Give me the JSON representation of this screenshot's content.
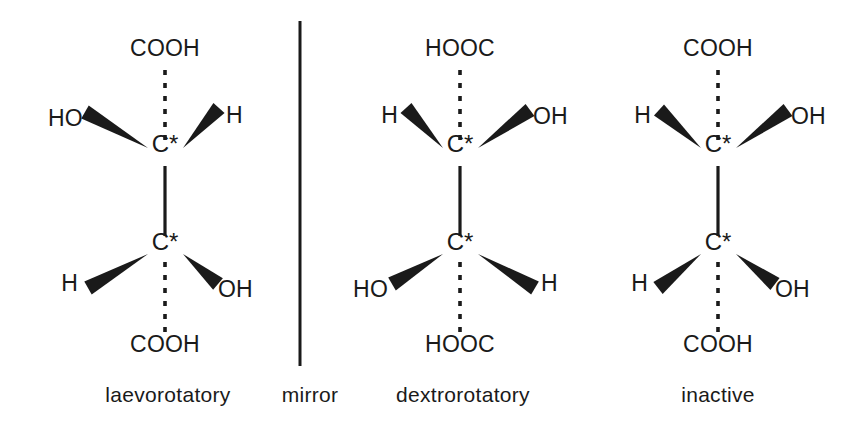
{
  "figure": {
    "background_color": "#ffffff",
    "ink_color": "#1a1a1a",
    "width": 868,
    "height": 429
  },
  "mirror": {
    "caption": "mirror",
    "caption_x": 310,
    "caption_y": 402,
    "line_x": 300,
    "line_y1": 21,
    "line_y2": 366
  },
  "molecules": [
    {
      "id": "laevorotatory",
      "caption": "laevorotatory",
      "caption_x": 168,
      "caption_y": 402,
      "center_x": 165,
      "top_carbon": {
        "label": "C*",
        "x": 165,
        "y": 152,
        "substituents": [
          {
            "name": "top",
            "text": "COOH",
            "bond": "dashed",
            "label_x": 165,
            "label_y": 56,
            "anchor": "middle",
            "tip_x": 165,
            "tip_y": 140,
            "end_x": 165,
            "end_y": 66
          },
          {
            "name": "upper-left",
            "text": "HO",
            "bond": "wedge",
            "label_x": 48,
            "label_y": 126,
            "anchor": "start",
            "tip_x": 148,
            "tip_y": 148,
            "end_x": 85,
            "end_y": 112
          },
          {
            "name": "upper-right",
            "text": "H",
            "bond": "wedge",
            "label_x": 226,
            "label_y": 123,
            "anchor": "start",
            "tip_x": 183,
            "tip_y": 148,
            "end_x": 219,
            "end_y": 108
          }
        ]
      },
      "bottom_carbon": {
        "label": "C*",
        "x": 165,
        "y": 250,
        "substituents": [
          {
            "name": "bottom",
            "text": "COOH",
            "bond": "dashed",
            "label_x": 165,
            "label_y": 352,
            "anchor": "middle",
            "tip_x": 165,
            "tip_y": 262,
            "end_x": 165,
            "end_y": 334
          },
          {
            "name": "lower-left",
            "text": "H",
            "bond": "wedge",
            "label_x": 78,
            "label_y": 291,
            "anchor": "end",
            "tip_x": 148,
            "tip_y": 254,
            "end_x": 88,
            "end_y": 288
          },
          {
            "name": "lower-right",
            "text": "OH",
            "bond": "wedge",
            "label_x": 218,
            "label_y": 297,
            "anchor": "start",
            "tip_x": 183,
            "tip_y": 254,
            "end_x": 218,
            "end_y": 284
          }
        ]
      },
      "backbone": {
        "x": 165,
        "y1": 166,
        "y2": 236
      }
    },
    {
      "id": "dextrorotatory",
      "caption": "dextrorotatory",
      "caption_x": 463,
      "caption_y": 402,
      "center_x": 460,
      "top_carbon": {
        "label": "C*",
        "x": 460,
        "y": 152,
        "substituents": [
          {
            "name": "top",
            "text": "HOOC",
            "bond": "dashed",
            "label_x": 460,
            "label_y": 56,
            "anchor": "middle",
            "tip_x": 460,
            "tip_y": 140,
            "end_x": 460,
            "end_y": 66
          },
          {
            "name": "upper-left",
            "text": "H",
            "bond": "wedge",
            "label_x": 398,
            "label_y": 123,
            "anchor": "end",
            "tip_x": 443,
            "tip_y": 148,
            "end_x": 406,
            "end_y": 108
          },
          {
            "name": "upper-right",
            "text": "OH",
            "bond": "wedge",
            "label_x": 533,
            "label_y": 124,
            "anchor": "start",
            "tip_x": 478,
            "tip_y": 148,
            "end_x": 530,
            "end_y": 110
          }
        ]
      },
      "bottom_carbon": {
        "label": "C*",
        "x": 460,
        "y": 250,
        "substituents": [
          {
            "name": "bottom",
            "text": "HOOC",
            "bond": "dashed",
            "label_x": 460,
            "label_y": 352,
            "anchor": "middle",
            "tip_x": 460,
            "tip_y": 262,
            "end_x": 460,
            "end_y": 334
          },
          {
            "name": "lower-left",
            "text": "HO",
            "bond": "wedge",
            "label_x": 388,
            "label_y": 297,
            "anchor": "end",
            "tip_x": 443,
            "tip_y": 254,
            "end_x": 392,
            "end_y": 284
          },
          {
            "name": "lower-right",
            "text": "H",
            "bond": "wedge",
            "label_x": 541,
            "label_y": 291,
            "anchor": "start",
            "tip_x": 478,
            "tip_y": 254,
            "end_x": 535,
            "end_y": 288
          }
        ]
      },
      "backbone": {
        "x": 460,
        "y1": 166,
        "y2": 236
      }
    },
    {
      "id": "inactive",
      "caption": "inactive",
      "caption_x": 718,
      "caption_y": 402,
      "center_x": 718,
      "top_carbon": {
        "label": "C*",
        "x": 718,
        "y": 152,
        "substituents": [
          {
            "name": "top",
            "text": "COOH",
            "bond": "dashed",
            "label_x": 718,
            "label_y": 56,
            "anchor": "middle",
            "tip_x": 718,
            "tip_y": 140,
            "end_x": 718,
            "end_y": 66
          },
          {
            "name": "upper-left",
            "text": "H",
            "bond": "wedge",
            "label_x": 651,
            "label_y": 123,
            "anchor": "end",
            "tip_x": 701,
            "tip_y": 148,
            "end_x": 659,
            "end_y": 110
          },
          {
            "name": "upper-right",
            "text": "OH",
            "bond": "wedge",
            "label_x": 791,
            "label_y": 124,
            "anchor": "start",
            "tip_x": 736,
            "tip_y": 148,
            "end_x": 788,
            "end_y": 110
          }
        ]
      },
      "bottom_carbon": {
        "label": "C*",
        "x": 718,
        "y": 250,
        "substituents": [
          {
            "name": "bottom",
            "text": "COOH",
            "bond": "dashed",
            "label_x": 718,
            "label_y": 352,
            "anchor": "middle",
            "tip_x": 718,
            "tip_y": 262,
            "end_x": 718,
            "end_y": 334
          },
          {
            "name": "lower-left",
            "text": "H",
            "bond": "wedge",
            "label_x": 648,
            "label_y": 291,
            "anchor": "end",
            "tip_x": 701,
            "tip_y": 254,
            "end_x": 658,
            "end_y": 288
          },
          {
            "name": "lower-right",
            "text": "OH",
            "bond": "wedge",
            "label_x": 775,
            "label_y": 297,
            "anchor": "start",
            "tip_x": 736,
            "tip_y": 254,
            "end_x": 775,
            "end_y": 284
          }
        ]
      },
      "backbone": {
        "x": 718,
        "y1": 166,
        "y2": 236
      }
    }
  ]
}
